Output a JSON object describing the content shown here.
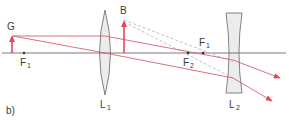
{
  "diagram": {
    "part_label": "b)",
    "object_label": "G",
    "image_label": "B",
    "focal_points": [
      {
        "name": "F",
        "sub": "1",
        "position": "left"
      },
      {
        "name": "F",
        "sub": "2",
        "position": "middle"
      },
      {
        "name": "F",
        "sub": "1",
        "position": "right"
      }
    ],
    "lenses": [
      {
        "name": "L",
        "sub": "1",
        "type": "convex"
      },
      {
        "name": "L",
        "sub": "2",
        "type": "concave"
      }
    ],
    "colors": {
      "ray": "#e4485a",
      "ray_thin": "#d8606c",
      "dashed": "#b8b8b8",
      "axis": "#555555",
      "lens_fill": "#ececec",
      "lens_stroke": "#666666"
    }
  }
}
